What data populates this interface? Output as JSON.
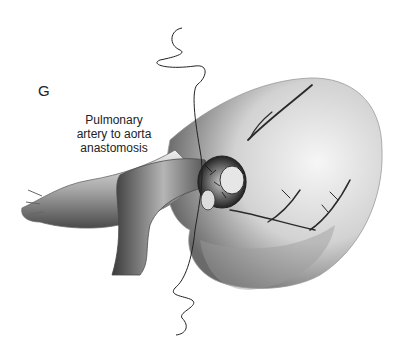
{
  "figure": {
    "panel_label": "G",
    "caption_lines": [
      "Pulmonary",
      "artery to aorta",
      "anastomosis"
    ],
    "illustration": "heart-surgery-illustration",
    "palette": {
      "background": "#ffffff",
      "ink": "#222222",
      "shade_dark": "#3a3a3a",
      "shade_mid": "#8a8a8a",
      "shade_light": "#d8d8d8"
    }
  }
}
